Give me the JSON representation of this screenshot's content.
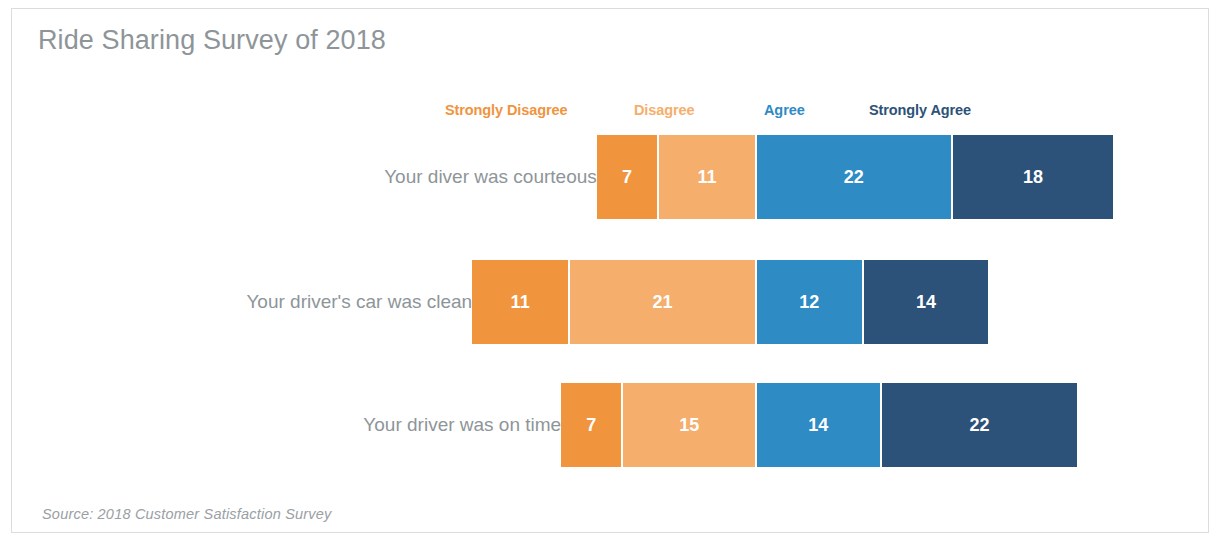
{
  "chart_data": {
    "type": "bar",
    "subtype": "diverging-stacked-bar",
    "title": "Ride Sharing Survey of 2018",
    "source_note": "Source: 2018 Customer Satisfaction Survey",
    "xlabel": "",
    "ylabel": "",
    "grid": false,
    "legend_position": "top",
    "orientation": "horizontal",
    "categories": [
      "Your diver was courteous",
      "Your driver's car was clean",
      "Your driver was on time"
    ],
    "series": [
      {
        "name": "Strongly Disagree",
        "color": "#F0943E",
        "label_color": "#F0943E",
        "values": [
          7,
          11,
          7
        ]
      },
      {
        "name": "Disagree",
        "color": "#F5AE6B",
        "label_color": "#F5AE6B",
        "values": [
          11,
          21,
          15
        ]
      },
      {
        "name": "Agree",
        "color": "#2E8BC4",
        "label_color": "#2E8BC4",
        "values": [
          22,
          12,
          14
        ]
      },
      {
        "name": "Strongly Agree",
        "color": "#2C5279",
        "label_color": "#2C5279",
        "values": [
          18,
          14,
          22
        ]
      }
    ],
    "value_labels_shown": true,
    "px_per_unit": 8.9,
    "neutral_axis_px": 745,
    "title_color": "#8E9599",
    "category_label_color": "#8E9599",
    "value_label_color": "#FFFFFF",
    "background_color": "#FFFFFF",
    "border_color": "#DCDCDC"
  }
}
